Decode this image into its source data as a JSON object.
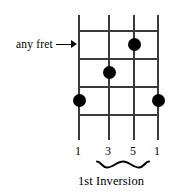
{
  "diagram": {
    "type": "guitar-chord-fretboard",
    "colors": {
      "line": "#3a3a3a",
      "dot": "#000000",
      "text": "#000000",
      "background": "#ffffff"
    },
    "grid": {
      "strings_count": 4,
      "frets_count": 4,
      "string_x": [
        78,
        108,
        133,
        157
      ],
      "fret_y": [
        30,
        58,
        86,
        114
      ],
      "string_top": 15,
      "string_bottom": 140,
      "fret_left": 78,
      "fret_right": 157
    },
    "dots": [
      {
        "name": "dot-string-3-fret-1",
        "x": 133,
        "y": 44,
        "degree": "5"
      },
      {
        "name": "dot-string-2-fret-2",
        "x": 108,
        "y": 72,
        "degree": "3"
      },
      {
        "name": "dot-string-1-fret-3",
        "x": 78,
        "y": 100,
        "degree": "1"
      },
      {
        "name": "dot-string-4-fret-3",
        "x": 157,
        "y": 100,
        "degree": "1"
      }
    ],
    "annotation": {
      "text": "any fret",
      "arrow": "right-arrow",
      "points_to_y": 44
    },
    "degree_labels": [
      {
        "value": "1",
        "x": 78
      },
      {
        "value": "3",
        "x": 108
      },
      {
        "value": "5",
        "x": 133
      },
      {
        "value": "1",
        "x": 157
      }
    ],
    "brace": {
      "spans_labels": [
        "3",
        "5"
      ],
      "left": 96,
      "right": 150
    },
    "caption": "1st Inversion"
  }
}
